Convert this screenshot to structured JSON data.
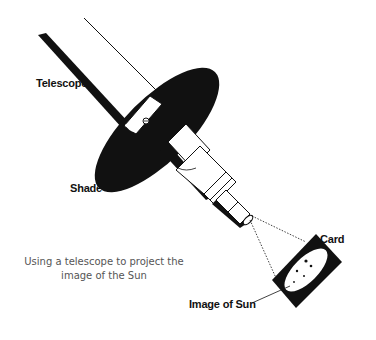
{
  "figure": {
    "type": "illustration",
    "colors": {
      "ink": "#111111",
      "paper": "#ffffff",
      "caption": "#555555"
    }
  },
  "labels": {
    "telescope": "Telescope",
    "shade": "Shade",
    "card": "Card",
    "image_of_sun": "Image of Sun"
  },
  "caption": {
    "line1": "Using a telescope to project the",
    "line2": "image of the Sun"
  }
}
